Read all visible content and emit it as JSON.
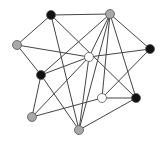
{
  "diagram": {
    "type": "graph",
    "colors": {
      "black": "#111111",
      "gray": "#a8a8a8",
      "white": "#ffffff",
      "edge": "#444444",
      "stroke": "#555555"
    },
    "nodes": [
      {
        "id": "A",
        "x": 51,
        "y": 15,
        "color": "black"
      },
      {
        "id": "B",
        "x": 110,
        "y": 14,
        "color": "gray"
      },
      {
        "id": "C",
        "x": 17,
        "y": 45,
        "color": "gray"
      },
      {
        "id": "D",
        "x": 150,
        "y": 49,
        "color": "black"
      },
      {
        "id": "E",
        "x": 89,
        "y": 57,
        "color": "white"
      },
      {
        "id": "F",
        "x": 41,
        "y": 75,
        "color": "black"
      },
      {
        "id": "G",
        "x": 102,
        "y": 98,
        "color": "white"
      },
      {
        "id": "H",
        "x": 136,
        "y": 98,
        "color": "black"
      },
      {
        "id": "I",
        "x": 32,
        "y": 117,
        "color": "gray"
      },
      {
        "id": "J",
        "x": 79,
        "y": 130,
        "color": "gray"
      }
    ],
    "edges": [
      [
        "A",
        "B"
      ],
      [
        "A",
        "C"
      ],
      [
        "A",
        "J"
      ],
      [
        "A",
        "H"
      ],
      [
        "B",
        "E"
      ],
      [
        "B",
        "F"
      ],
      [
        "B",
        "G"
      ],
      [
        "B",
        "H"
      ],
      [
        "B",
        "D"
      ],
      [
        "B",
        "J"
      ],
      [
        "C",
        "E"
      ],
      [
        "C",
        "F"
      ],
      [
        "D",
        "E"
      ],
      [
        "D",
        "G"
      ],
      [
        "E",
        "F"
      ],
      [
        "E",
        "I"
      ],
      [
        "E",
        "J"
      ],
      [
        "F",
        "I"
      ],
      [
        "F",
        "J"
      ],
      [
        "G",
        "H"
      ],
      [
        "G",
        "I"
      ],
      [
        "H",
        "J"
      ]
    ]
  }
}
